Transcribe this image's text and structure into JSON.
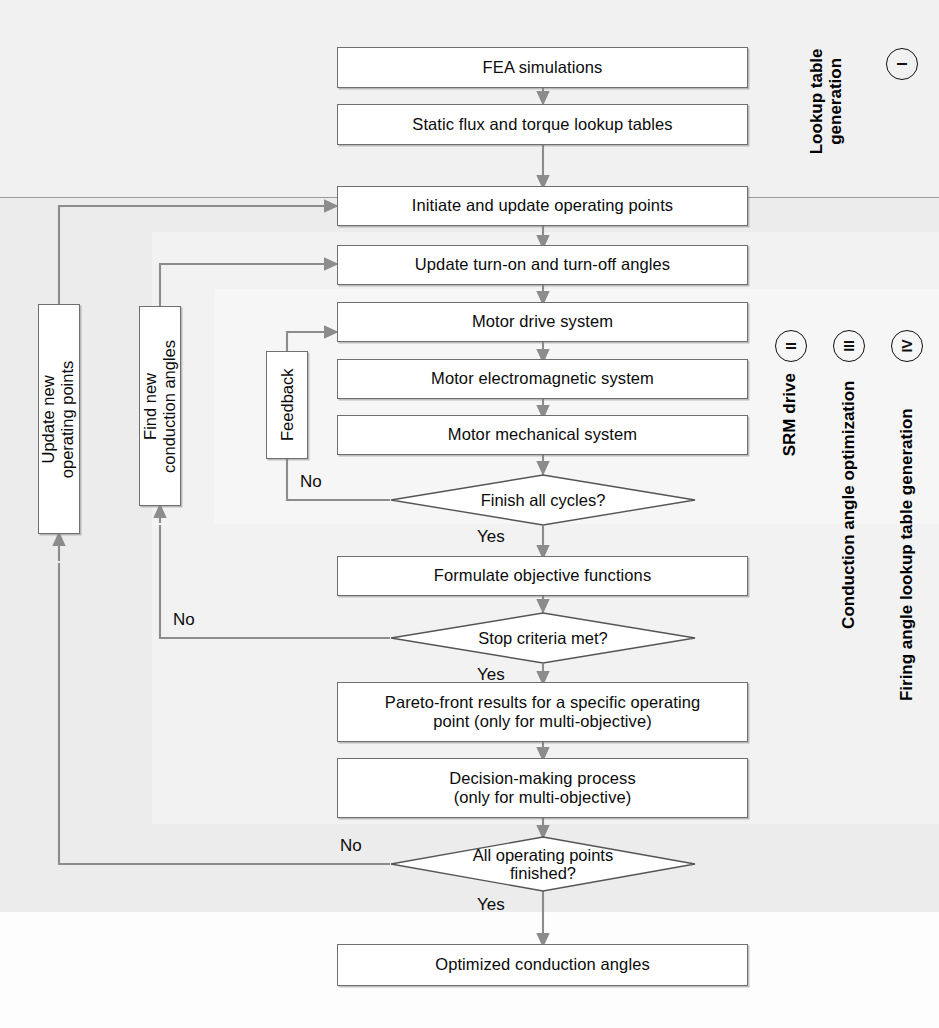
{
  "figure": {
    "kind": "flowchart"
  },
  "bands": [
    {
      "id": "lookup",
      "caption": "Lookup table generation",
      "roman": "I"
    },
    {
      "id": "srm",
      "caption": "SRM drive",
      "roman": "II"
    },
    {
      "id": "conduction",
      "caption": "Conduction angle optimization",
      "roman": "III"
    },
    {
      "id": "firing",
      "caption": "Firing angle lookup table generation",
      "roman": "IV"
    }
  ],
  "nodes": {
    "fea": "FEA simulations",
    "lookup_tables": "Static flux and torque lookup tables",
    "initiate": "Initiate and update operating points",
    "update_angles": "Update turn-on and turn-off angles",
    "motor_drive": "Motor drive system",
    "motor_em": "Motor electromagnetic system",
    "motor_mech": "Motor mechanical system",
    "formulate": "Formulate objective functions",
    "pareto_l1": "Pareto-front results for a specific operating",
    "pareto_l2": "point (only for multi-objective)",
    "decision_l1": "Decision-making process",
    "decision_l2": "(only for multi-objective)",
    "optimized": "Optimized conduction angles",
    "feedback": "Feedback",
    "update_new_l1": "Update new",
    "update_new_l2": "operating points",
    "find_new_l1": "Find new",
    "find_new_l2": "conduction angles"
  },
  "decisions": {
    "finish_cycles": "Finish all cycles?",
    "stop_criteria": "Stop criteria met?",
    "all_points_l1": "All operating points",
    "all_points_l2": "finished?"
  },
  "edge_labels": {
    "cycles_no": "No",
    "cycles_yes": "Yes",
    "stop_no": "No",
    "stop_yes": "Yes",
    "points_no": "No",
    "points_yes": "Yes"
  },
  "colors": {
    "page_background": "#fbfbfb",
    "band_lookup": "#f1f1f1",
    "band_firing": "#ececec",
    "band_conduction": "#f2f2f2",
    "band_srm": "#f6f6f6",
    "node_fill": "#ffffff",
    "node_stroke": "#6f6f6f",
    "wire": "#8c8c8c",
    "text": "#0b0b0b"
  }
}
